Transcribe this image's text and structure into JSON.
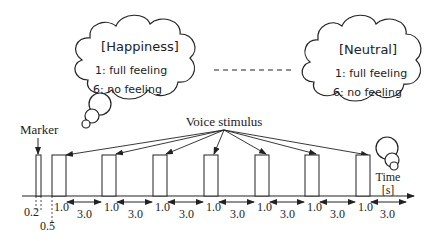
{
  "clouds": {
    "left": {
      "title": "[Happiness]",
      "line1": "1: full feeling",
      "line2": "6: no feeling"
    },
    "right": {
      "title": "[Neutral]",
      "line1": "1: full feeling",
      "line2": "6: no feeling"
    }
  },
  "labels": {
    "marker": "Marker",
    "voice_stimulus": "Voice stimulus",
    "time": "Time",
    "time_unit": "[s]"
  },
  "timing": {
    "marker_width": "0.2",
    "gap": "0.5",
    "stimulus_duration": "1.0",
    "interval": "3.0"
  },
  "colors": {
    "stroke": "#222222",
    "background": "#ffffff"
  }
}
